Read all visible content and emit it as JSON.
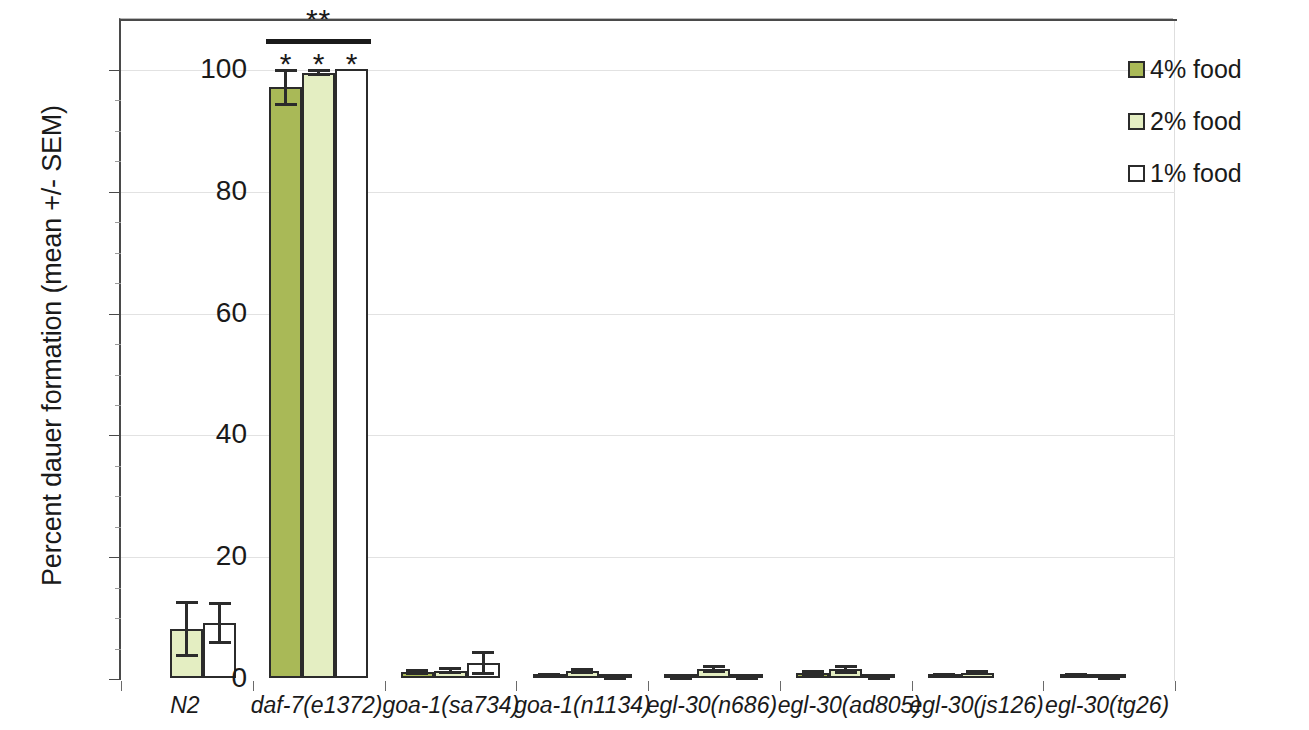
{
  "chart_data": {
    "type": "bar",
    "title": "",
    "subtitle": "",
    "xlabel": "",
    "ylabel": "Percent dauer formation (mean +/- SEM)",
    "ylim": [
      0,
      107
    ],
    "yticks": [
      0,
      20,
      40,
      60,
      80,
      100
    ],
    "ytick_labels": [
      "0",
      "20",
      "40",
      "60",
      "80",
      "100"
    ],
    "grid": "horizontal-faint",
    "legend_position": "right",
    "categories": [
      "N2",
      "daf-7(e1372)",
      "goa-1(sa734)",
      "goa-1(n1134)",
      "egl-30(n686)",
      "egl-30(ad805)",
      "egl-30(js126)",
      "egl-30(tg26)"
    ],
    "series": [
      {
        "name": "4% food",
        "color": "#a9b957",
        "values": [
          0,
          97,
          1.0,
          0.5,
          0.2,
          0.8,
          0.5,
          0.5
        ],
        "errors": [
          0,
          3,
          0.5,
          0.3,
          0.2,
          0.5,
          0.3,
          0.3
        ]
      },
      {
        "name": "2% food",
        "color": "#e4eec2",
        "values": [
          8,
          99.4,
          1.2,
          1.2,
          1.5,
          1.4,
          0.9,
          0.2
        ],
        "errors": [
          4.6,
          0.6,
          0.6,
          0.5,
          0.7,
          0.8,
          0.4,
          0.2
        ]
      },
      {
        "name": "1% food",
        "color": "#ffffff",
        "values": [
          9,
          100,
          2.5,
          0.2,
          0.2,
          0.2,
          0,
          0
        ],
        "errors": [
          3.4,
          0,
          2.0,
          0.1,
          0.1,
          0.1,
          0,
          0
        ]
      }
    ],
    "annotations": {
      "group_bracket": {
        "applies_to": "daf-7(e1372)",
        "label": "**"
      },
      "per_bar_stars": {
        "applies_to": "daf-7(e1372)",
        "labels": [
          "*",
          "*",
          "*"
        ]
      }
    }
  },
  "legend": {
    "items": [
      {
        "label": "4% food",
        "color": "#a9b957"
      },
      {
        "label": "2% food",
        "color": "#e4eec2"
      },
      {
        "label": "1% food",
        "color": "#ffffff"
      }
    ]
  }
}
